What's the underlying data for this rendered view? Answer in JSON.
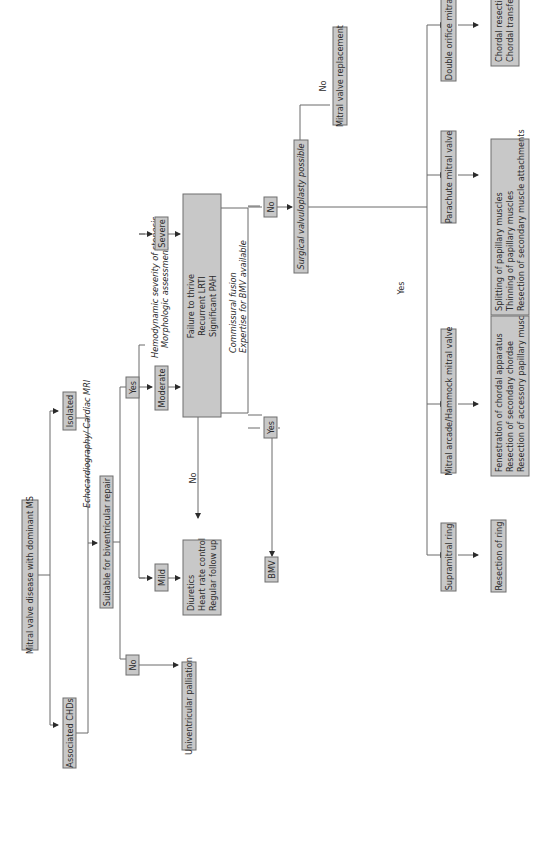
{
  "diagram": {
    "type": "flowchart",
    "orientation": "rotated-90-ccw",
    "nodes": {
      "root": "Mitral valve disease with dominant MS",
      "associated_chds": "Associated CHDs",
      "isolated": "Isolated",
      "suitable": "Suitable for biventricular repair",
      "no_univ": "No",
      "univentricular": "Univentricular palliation",
      "yes_biv": "Yes",
      "mild": "Mild",
      "moderate": "Moderate",
      "severe": "Severe",
      "medical": [
        "Diuretics",
        "Heart rate control",
        "Regular follow up"
      ],
      "symptoms": [
        "Failure to thrive",
        "Recurrent LRTI",
        "Significant PAH"
      ],
      "yes_bmv": "Yes",
      "bmv": "BMV",
      "no_bmv": "No",
      "surgical": "Surgical valvuloplasty possible",
      "mvr": "Mitral valve replacement",
      "supramitral": "Supramitral ring",
      "arcade": "Mitral arcade/Hammock mitral valve",
      "parachute": "Parachute mitral valve",
      "double_orifice": "Double orifice mitral valve",
      "resect_ring": "Resection of ring",
      "arcade_tx": [
        "Fenestration of chordal apparatus",
        "Resection of secondary chordae",
        "Resection of accessory papillary muscles"
      ],
      "parachute_tx": [
        "Splitting of papillary muscles",
        "Thinning of papillary muscles",
        "Resection of secondary muscle attachments"
      ],
      "double_tx": [
        "Chordal resection",
        "Chordal transfer"
      ]
    },
    "annotations": {
      "imaging": "Echocardiography/ Cardiac MRI",
      "severity": [
        "Hemodynamic severity of stenosis",
        "Morphologic assessment"
      ],
      "bmv_criteria": [
        "Commissural fusion",
        "Expertise for BMV available"
      ]
    },
    "edge_labels": {
      "no_to_medical": "No",
      "no_to_mvr": "No",
      "yes_to_repairs": "Yes"
    },
    "colors": {
      "box_fill": "#c8c8c8",
      "box_stroke": "#6e6e6e",
      "line": "#6a6a6a",
      "text": "#2b2b2b"
    }
  }
}
